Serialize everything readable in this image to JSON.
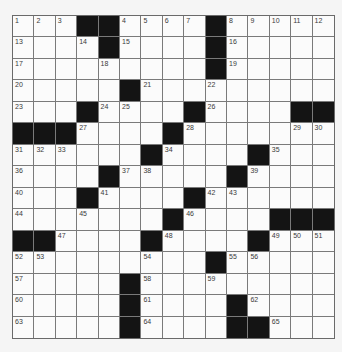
{
  "puzzle": {
    "size": {
      "rows": 15,
      "cols": 15
    },
    "colors": {
      "black": "#141414",
      "white": "#fbfbfb",
      "line": "#7a7a7a",
      "background": "#f5f5f5"
    },
    "rows": [
      "...##....#.....",
      "....#....#.....",
      ".........#.....",
      ".....#.........",
      "...#....#....##",
      "###....#.......",
      "......#....#...",
      "....#.....#....",
      "...#....#......",
      ".......#....###",
      "##....#....#...",
      ".........#.....",
      ".....#.........",
      ".....#....#....",
      ".....#....##..."
    ],
    "numbers": [
      {
        "r": 0,
        "c": 0,
        "n": "1"
      },
      {
        "r": 0,
        "c": 1,
        "n": "2"
      },
      {
        "r": 0,
        "c": 2,
        "n": "3"
      },
      {
        "r": 0,
        "c": 5,
        "n": "4"
      },
      {
        "r": 0,
        "c": 6,
        "n": "5"
      },
      {
        "r": 0,
        "c": 7,
        "n": "6"
      },
      {
        "r": 0,
        "c": 8,
        "n": "7"
      },
      {
        "r": 0,
        "c": 10,
        "n": "8"
      },
      {
        "r": 0,
        "c": 11,
        "n": "9"
      },
      {
        "r": 0,
        "c": 12,
        "n": "10"
      },
      {
        "r": 0,
        "c": 13,
        "n": "11"
      },
      {
        "r": 0,
        "c": 14,
        "n": "12"
      },
      {
        "r": 1,
        "c": 0,
        "n": "13"
      },
      {
        "r": 1,
        "c": 3,
        "n": "14"
      },
      {
        "r": 1,
        "c": 5,
        "n": "15"
      },
      {
        "r": 1,
        "c": 10,
        "n": "16"
      },
      {
        "r": 2,
        "c": 0,
        "n": "17"
      },
      {
        "r": 2,
        "c": 4,
        "n": "18"
      },
      {
        "r": 2,
        "c": 10,
        "n": "19"
      },
      {
        "r": 3,
        "c": 0,
        "n": "20"
      },
      {
        "r": 3,
        "c": 6,
        "n": "21"
      },
      {
        "r": 3,
        "c": 9,
        "n": "22"
      },
      {
        "r": 4,
        "c": 0,
        "n": "23"
      },
      {
        "r": 4,
        "c": 4,
        "n": "24"
      },
      {
        "r": 4,
        "c": 5,
        "n": "25"
      },
      {
        "r": 4,
        "c": 9,
        "n": "26"
      },
      {
        "r": 5,
        "c": 3,
        "n": "27"
      },
      {
        "r": 5,
        "c": 8,
        "n": "28"
      },
      {
        "r": 5,
        "c": 13,
        "n": "29"
      },
      {
        "r": 5,
        "c": 14,
        "n": "30"
      },
      {
        "r": 6,
        "c": 0,
        "n": "31"
      },
      {
        "r": 6,
        "c": 1,
        "n": "32"
      },
      {
        "r": 6,
        "c": 2,
        "n": "33"
      },
      {
        "r": 6,
        "c": 7,
        "n": "34"
      },
      {
        "r": 6,
        "c": 12,
        "n": "35"
      },
      {
        "r": 7,
        "c": 0,
        "n": "36"
      },
      {
        "r": 7,
        "c": 5,
        "n": "37"
      },
      {
        "r": 7,
        "c": 6,
        "n": "38"
      },
      {
        "r": 7,
        "c": 11,
        "n": "39"
      },
      {
        "r": 8,
        "c": 0,
        "n": "40"
      },
      {
        "r": 8,
        "c": 4,
        "n": "41"
      },
      {
        "r": 8,
        "c": 9,
        "n": "42"
      },
      {
        "r": 8,
        "c": 10,
        "n": "43"
      },
      {
        "r": 9,
        "c": 0,
        "n": "44"
      },
      {
        "r": 9,
        "c": 3,
        "n": "45"
      },
      {
        "r": 9,
        "c": 8,
        "n": "46"
      },
      {
        "r": 10,
        "c": 2,
        "n": "47"
      },
      {
        "r": 10,
        "c": 7,
        "n": "48"
      },
      {
        "r": 10,
        "c": 12,
        "n": "49"
      },
      {
        "r": 10,
        "c": 13,
        "n": "50"
      },
      {
        "r": 10,
        "c": 14,
        "n": "51"
      },
      {
        "r": 11,
        "c": 0,
        "n": "52"
      },
      {
        "r": 11,
        "c": 1,
        "n": "53"
      },
      {
        "r": 11,
        "c": 6,
        "n": "54"
      },
      {
        "r": 11,
        "c": 10,
        "n": "55"
      },
      {
        "r": 11,
        "c": 11,
        "n": "56"
      },
      {
        "r": 12,
        "c": 0,
        "n": "57"
      },
      {
        "r": 12,
        "c": 6,
        "n": "58"
      },
      {
        "r": 12,
        "c": 9,
        "n": "59"
      },
      {
        "r": 13,
        "c": 0,
        "n": "60"
      },
      {
        "r": 13,
        "c": 6,
        "n": "61"
      },
      {
        "r": 13,
        "c": 11,
        "n": "62"
      },
      {
        "r": 14,
        "c": 0,
        "n": "63"
      },
      {
        "r": 14,
        "c": 6,
        "n": "64"
      },
      {
        "r": 14,
        "c": 12,
        "n": "65"
      }
    ]
  }
}
